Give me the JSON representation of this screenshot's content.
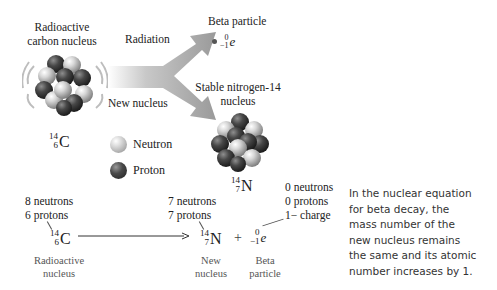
{
  "top": {
    "carbon_title_line1": "Radioactive",
    "carbon_title_line2": "carbon nucleus",
    "carbon_symbol": {
      "mass": "14",
      "atomic": "6",
      "element": "C"
    },
    "arrow_upper_label": "Radiation",
    "arrow_lower_label": "New nucleus",
    "beta_title": "Beta particle",
    "beta_symbol": {
      "mass": "0",
      "atomic": "−1",
      "element": "e"
    },
    "nitrogen_title_line1": "Stable nitrogen-14",
    "nitrogen_title_line2": "nucleus",
    "nitrogen_symbol": {
      "mass": "14",
      "atomic": "7",
      "element": "N"
    }
  },
  "legend": {
    "items": [
      {
        "label": "Neutron",
        "icon": "neutron-ball-icon",
        "color": "#d0d0d0"
      },
      {
        "label": "Proton",
        "icon": "proton-ball-icon",
        "color": "#3a3a3a"
      }
    ]
  },
  "equation": {
    "reactant": {
      "neutrons": "8 neutrons",
      "protons": "6 protons",
      "symbol": {
        "mass": "14",
        "atomic": "6",
        "element": "C"
      },
      "caption_line1": "Radioactive",
      "caption_line2": "nucleus"
    },
    "product": {
      "neutrons": "7 neutrons",
      "protons": "7 protons",
      "symbol": {
        "mass": "14",
        "atomic": "7",
        "element": "N"
      },
      "caption_line1": "New",
      "caption_line2": "nucleus"
    },
    "plus": "+",
    "beta": {
      "neutrons": "0 neutrons",
      "protons": "0 protons",
      "charge": "1− charge",
      "symbol": {
        "mass": "0",
        "atomic": "−1",
        "element": "e"
      },
      "caption_line1": "Beta",
      "caption_line2": "particle"
    }
  },
  "note": {
    "text": "In the nuclear equation for beta decay, the mass number of the new nucleus remains the same and its atomic number increases by 1."
  },
  "colors": {
    "arrow_gray": "#9a9a9a",
    "neutron": "#d0d0d0",
    "proton": "#3a3a3a"
  }
}
